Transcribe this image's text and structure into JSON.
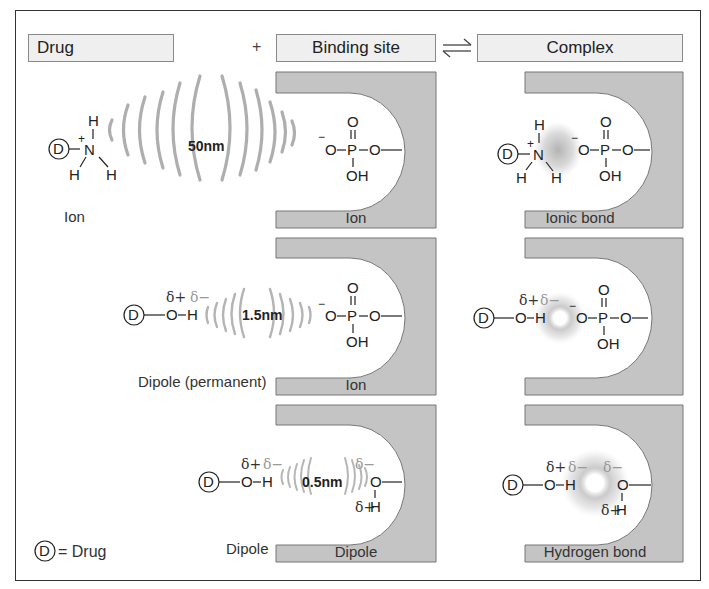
{
  "header": {
    "drug": "Drug",
    "plus": "+",
    "binding_site": "Binding site",
    "equilibrium_symbol": "⇌",
    "complex": "Complex"
  },
  "rows": [
    {
      "drug_label": "Ion",
      "distance": "50nm",
      "site_label": "Ion",
      "complex_label": "Ionic bond",
      "drug_group": "NH3+",
      "site_group": "-O-P(=O)(OH)-O-"
    },
    {
      "drug_label": "Dipole (permanent)",
      "distance": "1.5nm",
      "site_label": "Ion",
      "complex_label": "",
      "drug_group": "O-H (δ+ δ−)",
      "site_group": "-O-P(=O)(OH)-O-"
    },
    {
      "drug_label": "Dipole",
      "distance": "0.5nm",
      "site_label": "Dipole",
      "complex_label": "Hydrogen bond",
      "drug_group": "O-H (δ+ δ−)",
      "site_group": "O-H (δ− δ+)"
    }
  ],
  "legend": {
    "symbol": "D",
    "text": "= Drug"
  },
  "chem": {
    "D": "D",
    "N": "N",
    "H": "H",
    "O": "O",
    "P": "P",
    "OH": "OH",
    "plus": "+",
    "minus": "−",
    "delta_plus": "δ+",
    "delta_minus": "δ−"
  },
  "colors": {
    "block_gray": "#c4c4c4",
    "header_fill": "#efefef",
    "wave_gray": "#9a9a9a",
    "frame": "#333333"
  }
}
